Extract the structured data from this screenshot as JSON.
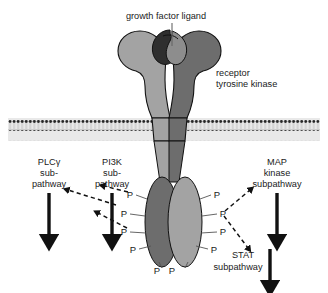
{
  "figure": {
    "background_color": "#ffffff",
    "ink_color": "#1a1a1a"
  },
  "colors": {
    "lobe_light": "#a3a3a3",
    "lobe_dark": "#6d6d6d",
    "ligand_dark": "#2e2e2e",
    "ligand_light": "#8d8d8d",
    "membrane_head": "#2b2b2b",
    "membrane_tail": "#c9c9c9",
    "membrane_band": "#efefef",
    "outline": "#111111",
    "arrow_solid": "#111111",
    "arrow_dashed": "#111111"
  },
  "annotations": {
    "ligand_label": "growth factor ligand",
    "receptor_label_line1": "receptor",
    "receptor_label_line2": "tyrosine kinase"
  },
  "pathways": [
    {
      "id": "plcg",
      "lines": [
        "PLCγ",
        "sub-",
        "pathway"
      ],
      "arrow": "solid-down"
    },
    {
      "id": "pi3k",
      "lines": [
        "PI3K",
        "sub-",
        "pathway"
      ],
      "arrow": "solid-down"
    },
    {
      "id": "map-kinase",
      "lines": [
        "MAP",
        "kinase",
        "subpathway"
      ],
      "arrow": "solid-down"
    },
    {
      "id": "stat",
      "lines": [
        "STAT",
        "subpathway"
      ],
      "arrow": "solid-down"
    }
  ],
  "phosphate_label": "P",
  "phosphates": {
    "left_side_count": 4,
    "right_side_count": 4,
    "bottom_count": 2,
    "total": 10
  },
  "membrane": {
    "label": "lipid bilayer",
    "head_count": 74
  },
  "icons": {
    "solid_arrow": "arrow-down-solid",
    "dashed_arrow": "arrow-dashed",
    "leader_line": "leader-line"
  }
}
